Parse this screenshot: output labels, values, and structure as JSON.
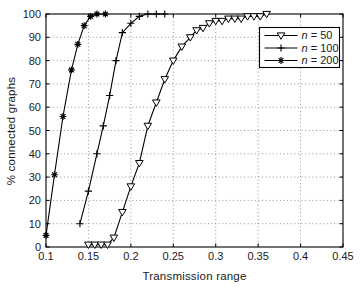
{
  "window": {
    "width": 360,
    "height": 292,
    "background": "#ffffff"
  },
  "chart_data": {
    "type": "line",
    "title": "",
    "xlabel": "Transmission range",
    "ylabel": "% connected graphs",
    "xlim": [
      0.1,
      0.45
    ],
    "ylim": [
      0,
      100
    ],
    "xticks": [
      0.1,
      0.15,
      0.2,
      0.25,
      0.3,
      0.35,
      0.4,
      0.45
    ],
    "xtick_labels": [
      "0.1",
      "0.15",
      "0.2",
      "0.25",
      "0.3",
      "0.35",
      "0.4",
      "0.45"
    ],
    "yticks": [
      0,
      10,
      20,
      30,
      40,
      50,
      60,
      70,
      80,
      90,
      100
    ],
    "ytick_labels": [
      "0",
      "10",
      "20",
      "30",
      "40",
      "50",
      "60",
      "70",
      "80",
      "90",
      "100"
    ],
    "grid": "dotted",
    "grid_color": "#787878",
    "axis_color": "#000000",
    "text_color": "#1a1a1a",
    "legend_position": "upper-right",
    "series": [
      {
        "legend_var": "n",
        "legend_eq": " = 50",
        "marker": "triangle-down",
        "color": "#000000",
        "x": [
          0.15,
          0.1575,
          0.165,
          0.1725,
          0.18,
          0.19,
          0.2,
          0.21,
          0.22,
          0.23,
          0.24,
          0.25,
          0.26,
          0.27,
          0.2775,
          0.285,
          0.2925,
          0.3,
          0.3075,
          0.315,
          0.3225,
          0.33,
          0.3375,
          0.345,
          0.3525,
          0.36
        ],
        "y": [
          1,
          1,
          1,
          1,
          4,
          15,
          26,
          36,
          52,
          62,
          72,
          80,
          86,
          90,
          93,
          94,
          96,
          97,
          97,
          98,
          98,
          98,
          99,
          99,
          99,
          100
        ]
      },
      {
        "legend_var": "n",
        "legend_eq": " = 100",
        "marker": "plus",
        "color": "#000000",
        "x": [
          0.14,
          0.15,
          0.16,
          0.1675,
          0.175,
          0.1825,
          0.19,
          0.2,
          0.21,
          0.22,
          0.23,
          0.24
        ],
        "y": [
          10,
          24,
          40,
          52,
          65,
          80,
          92,
          96,
          99,
          100,
          100,
          100
        ]
      },
      {
        "legend_var": "n",
        "legend_eq": " = 200",
        "marker": "asterisk",
        "color": "#000000",
        "x": [
          0.1,
          0.11,
          0.12,
          0.13,
          0.1375,
          0.145,
          0.1525,
          0.16,
          0.17
        ],
        "y": [
          5,
          31,
          56,
          76,
          87,
          95,
          99,
          100,
          100
        ]
      }
    ]
  }
}
